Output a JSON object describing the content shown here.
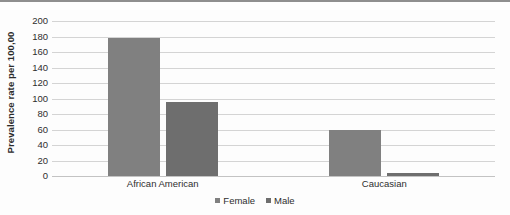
{
  "chart_data": {
    "type": "bar",
    "title": "",
    "subtitle": "",
    "xlabel": "",
    "ylabel": "Prevalence rate per 100,00",
    "categories": [
      "African American",
      "Caucasian"
    ],
    "series": [
      {
        "name": "Female",
        "color": "#808080",
        "values": [
          178,
          60
        ]
      },
      {
        "name": "Male",
        "color": "#6e6e6e",
        "values": [
          95,
          4
        ]
      }
    ],
    "ylim": [
      0,
      200
    ],
    "y_ticks": [
      200,
      180,
      160,
      140,
      120,
      100,
      80,
      60,
      40,
      20,
      0
    ],
    "y_tick_labels": [
      "200",
      "180",
      "160",
      "140",
      "120",
      "100",
      "80",
      "60",
      "40",
      "20",
      "0"
    ],
    "grid": true,
    "grid_axis": "y",
    "legend_position": "bottom",
    "legend": [
      {
        "label": "Female",
        "color": "#808080"
      },
      {
        "label": "Male",
        "color": "#6e6e6e"
      }
    ]
  }
}
